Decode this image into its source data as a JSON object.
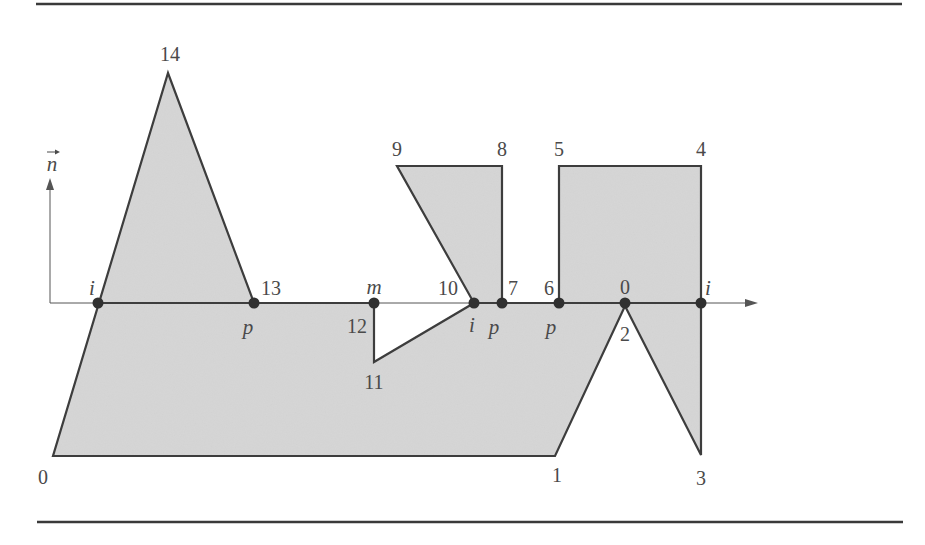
{
  "figure": {
    "colors": {
      "fill": "#d7d7d7",
      "stroke": "#3d3d3d",
      "axis": "#555555",
      "dot": "#303030",
      "rule": "#3a3a3a"
    },
    "rules": [
      {
        "name": "top-rule",
        "x1": 36,
        "y1": 4,
        "x2": 902,
        "y2": 4
      },
      {
        "name": "bottom-rule",
        "x1": 37,
        "y1": 522,
        "x2": 903,
        "y2": 522
      }
    ],
    "normal_vector": {
      "label": "n",
      "x": 50,
      "y_base": 303,
      "y_tip": 178,
      "label_x": 52,
      "label_y": 164
    },
    "axis": {
      "x_start": 50,
      "x_end": 758,
      "y": 303,
      "bold_segments": [
        [
          98,
          374
        ],
        [
          474,
          701
        ]
      ]
    },
    "polygon": {
      "vertices": [
        {
          "id": "0",
          "x": 53,
          "y": 456,
          "label_x": 43,
          "label_y": 477
        },
        {
          "id": "1",
          "x": 555,
          "y": 456,
          "label_x": 557,
          "label_y": 475
        },
        {
          "id": "2",
          "x": 625,
          "y": 306,
          "label_x": 625,
          "label_y": 334
        },
        {
          "id": "3",
          "x": 701,
          "y": 455,
          "label_x": 701,
          "label_y": 478
        },
        {
          "id": "4",
          "x": 701,
          "y": 166,
          "label_x": 701,
          "label_y": 149
        },
        {
          "id": "5",
          "x": 559,
          "y": 166,
          "label_x": 559,
          "label_y": 149
        },
        {
          "id": "6",
          "x": 559,
          "y": 303,
          "label_x": 549,
          "label_y": 288
        },
        {
          "id": "7",
          "x": 502,
          "y": 303,
          "label_x": 513,
          "label_y": 288
        },
        {
          "id": "8",
          "x": 502,
          "y": 166,
          "label_x": 502,
          "label_y": 149
        },
        {
          "id": "9",
          "x": 397,
          "y": 166,
          "label_x": 397,
          "label_y": 149
        },
        {
          "id": "10",
          "x": 474,
          "y": 303,
          "label_x": 448,
          "label_y": 288
        },
        {
          "id": "11",
          "x": 374,
          "y": 362,
          "label_x": 374,
          "label_y": 382
        },
        {
          "id": "12",
          "x": 374,
          "y": 303,
          "label_x": 357,
          "label_y": 326
        },
        {
          "id": "13",
          "x": 254,
          "y": 303,
          "label_x": 271,
          "label_y": 288
        },
        {
          "id": "14",
          "x": 168,
          "y": 73,
          "label_x": 170,
          "label_y": 54
        }
      ]
    },
    "intersection_points": [
      {
        "label": "i",
        "x": 98,
        "y": 303,
        "label_x": 92,
        "label_y": 288
      },
      {
        "label": "p",
        "x": 254,
        "y": 303,
        "label_x": 248,
        "label_y": 327
      },
      {
        "label": "m",
        "x": 374,
        "y": 303,
        "label_x": 374,
        "label_y": 287
      },
      {
        "label": "i",
        "x": 474,
        "y": 303,
        "label_x": 472,
        "label_y": 325
      },
      {
        "label": "p",
        "x": 502,
        "y": 303,
        "label_x": 494,
        "label_y": 327
      },
      {
        "label": "p",
        "x": 559,
        "y": 303,
        "label_x": 551,
        "label_y": 327
      },
      {
        "label": "0",
        "x": 625,
        "y": 303,
        "label_x": 625,
        "label_y": 287,
        "upright": true
      },
      {
        "label": "i",
        "x": 701,
        "y": 303,
        "label_x": 708,
        "label_y": 288
      }
    ]
  }
}
